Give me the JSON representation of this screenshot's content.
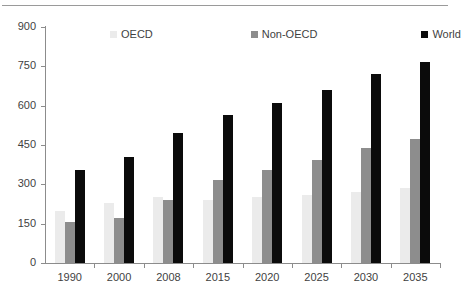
{
  "chart_data": {
    "type": "bar",
    "title": "",
    "subtitle": "",
    "xlabel": "",
    "ylabel": "",
    "categories": [
      "1990",
      "2000",
      "2008",
      "2015",
      "2020",
      "2025",
      "2030",
      "2035"
    ],
    "series": [
      {
        "name": "OECD",
        "color": "#ebebeb",
        "values": [
          200,
          230,
          250,
          242,
          253,
          260,
          272,
          285
        ]
      },
      {
        "name": "Non-OECD",
        "color": "#8d8d8d",
        "values": [
          155,
          170,
          240,
          315,
          355,
          393,
          438,
          473
        ]
      },
      {
        "name": "World",
        "color": "#0b0b0b",
        "values": [
          355,
          403,
          496,
          565,
          610,
          660,
          720,
          765
        ]
      }
    ],
    "ylim": [
      0,
      900
    ],
    "yticks": [
      0,
      150,
      300,
      450,
      600,
      750,
      900
    ],
    "ytick_labels": [
      "0",
      "150",
      "300",
      "450",
      "600",
      "750",
      "900"
    ],
    "grid": false,
    "legend_position": "top-center",
    "legend": [
      "OECD",
      "Non-OECD",
      "World"
    ]
  },
  "axes": {
    "y_tick_labels": [
      "900",
      "750",
      "600",
      "450",
      "300",
      "150",
      "0"
    ],
    "x_tick_labels": [
      "1990",
      "2000",
      "2008",
      "2015",
      "2020",
      "2025",
      "2030",
      "2035"
    ]
  }
}
